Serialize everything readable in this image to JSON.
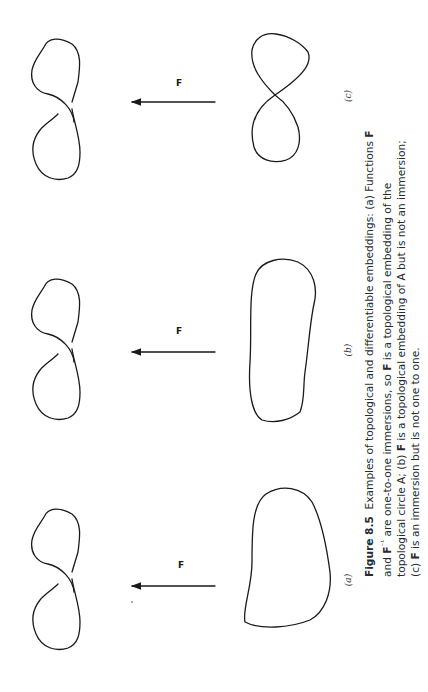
{
  "figure": {
    "number": "Figure 8.5",
    "panels": [
      {
        "id": "a",
        "label": "(a)",
        "map_label": "F",
        "domain": "figure-eight (non-crossing, topological circle)",
        "image": "simple closed curve"
      },
      {
        "id": "b",
        "label": "(b)",
        "map_label": "F",
        "domain": "figure-eight (non-crossing, topological circle)",
        "image": "closed curve with cusp"
      },
      {
        "id": "c",
        "label": "(c)",
        "map_label": "F",
        "domain": "figure-eight (non-crossing, topological circle)",
        "image": "figure-eight with self-crossing"
      }
    ]
  },
  "caption": {
    "label": "Figure 8.5",
    "lines": [
      [
        {
          "t": "Examples of topological and differentiable embeddings: (a) Functions "
        },
        {
          "t": "F",
          "b": true
        }
      ],
      [
        {
          "t": "and "
        },
        {
          "t": "F",
          "b": true
        },
        {
          "t": "⁻¹",
          "sup": true
        },
        {
          "t": " are one-to-one immersions, so "
        },
        {
          "t": "F",
          "b": true
        },
        {
          "t": " is a topological embedding of the"
        }
      ],
      [
        {
          "t": "topological circle A; (b) "
        },
        {
          "t": "F",
          "b": true
        },
        {
          "t": " is a topological embedding of A but is not an immersion;"
        }
      ],
      [
        {
          "t": "(c) "
        },
        {
          "t": "F",
          "b": true
        },
        {
          "t": " is an immersion but is not one to one."
        }
      ]
    ],
    "full_text": "Figure 8.5 Examples of topological and differentiable embeddings: (a) Functions F and F⁻¹ are one-to-one immersions, so F is a topological embedding of the topological circle A; (b) F is a topological embedding of A but is not an immersion; (c) F is an immersion but is not one to one."
  }
}
